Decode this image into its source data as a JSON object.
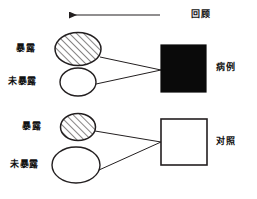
{
  "figure": {
    "type": "case-control-study-diagram",
    "background_color": "#ffffff",
    "stroke_color": "#231f20",
    "timeline": {
      "label": "回顾",
      "direction": "left",
      "arrow_from_x": 160,
      "arrow_to_x": 65,
      "y": 15
    },
    "groups": [
      {
        "id": "case-group",
        "outcome_label": "病例",
        "outcome_shape": "square",
        "outcome_fill": "#0a0a0a",
        "arms": [
          {
            "id": "case-exposed",
            "label": "暴露",
            "fill": "hatched",
            "shape": "circle",
            "cx": 78,
            "cy": 49,
            "rx": 23,
            "ry": 16
          },
          {
            "id": "case-unexposed",
            "label": "未暴露",
            "fill": "white",
            "shape": "circle",
            "cx": 78,
            "cy": 82,
            "rx": 18,
            "ry": 14
          }
        ]
      },
      {
        "id": "control-group",
        "outcome_label": "对照",
        "outcome_shape": "square",
        "outcome_fill": "#ffffff",
        "arms": [
          {
            "id": "control-exposed",
            "label": "暴露",
            "fill": "hatched",
            "shape": "circle",
            "cx": 78,
            "cy": 127,
            "rx": 17,
            "ry": 13
          },
          {
            "id": "control-unexposed",
            "label": "未暴露",
            "fill": "white",
            "shape": "circle",
            "cx": 76,
            "cy": 165,
            "rx": 24,
            "ry": 18
          }
        ]
      }
    ],
    "legend_notes": {
      "hatched_meaning": "暴露",
      "plain_meaning": "未暴露"
    }
  }
}
